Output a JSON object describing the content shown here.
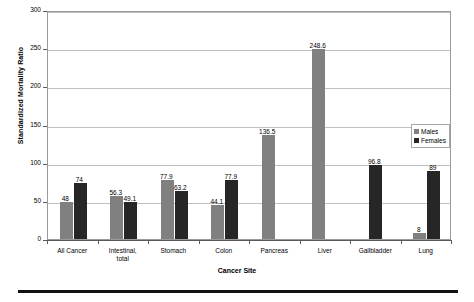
{
  "chart_data": {
    "type": "bar",
    "title": "",
    "xlabel": "Cancer Site",
    "ylabel": "Standardized Mortality Ratio",
    "ylim": [
      0,
      300
    ],
    "yticks": [
      0,
      50,
      100,
      150,
      200,
      250,
      300
    ],
    "ytick_labels": [
      "0",
      "50",
      "100",
      "150",
      "200",
      "250",
      "300"
    ],
    "grid": true,
    "legend_position": "right",
    "categories": [
      "All Cancer",
      "Intestinal, total",
      "Stomach",
      "Colon",
      "Pancreas",
      "Liver",
      "Gallbladder",
      "Lung"
    ],
    "series": [
      {
        "name": "Males",
        "color": "#808080",
        "values": [
          48,
          56.3,
          77.9,
          44.1,
          136.5,
          248.6,
          null,
          8
        ],
        "labels": [
          "48",
          "56.3",
          "77.9",
          "44.1",
          "136.5",
          "248.6",
          "",
          "8"
        ]
      },
      {
        "name": "Females",
        "color": "#262626",
        "values": [
          74,
          49.1,
          63.2,
          77.9,
          null,
          null,
          96.8,
          89
        ],
        "labels": [
          "74",
          "49.1",
          "63.2",
          "77.9",
          "",
          "",
          "96.8",
          "89"
        ]
      }
    ]
  },
  "legend": {
    "items": [
      {
        "label": "Males"
      },
      {
        "label": "Females"
      }
    ]
  }
}
